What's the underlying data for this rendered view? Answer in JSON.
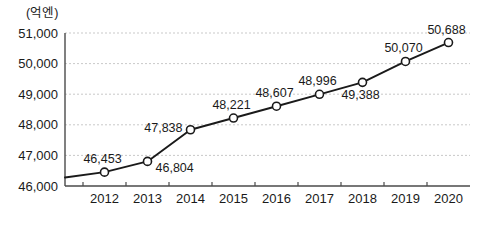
{
  "chart_data": {
    "type": "line",
    "title": "",
    "subtitle": "",
    "xlabel": "",
    "ylabel": "",
    "unit_label": "(억엔)",
    "categories": [
      "2012",
      "2013",
      "2014",
      "2015",
      "2016",
      "2017",
      "2018",
      "2019",
      "2020"
    ],
    "values": [
      46453,
      46804,
      47838,
      48221,
      48607,
      48996,
      49388,
      50070,
      50688
    ],
    "point_labels": [
      "46,453",
      "46,804",
      "47,838",
      "48,221",
      "48,607",
      "48,996",
      "49,388",
      "50,070",
      "50,688"
    ],
    "label_placement": [
      "above",
      "right",
      "left",
      "above",
      "above",
      "above",
      "below",
      "above",
      "above"
    ],
    "ylim": [
      46000,
      51000
    ],
    "ytick_values": [
      46000,
      47000,
      48000,
      49000,
      50000,
      51000
    ],
    "ytick_labels": [
      "46,000",
      "47,000",
      "48,000",
      "49,000",
      "50,000",
      "51,000"
    ],
    "xtick_labels": [
      "2012",
      "2013",
      "2014",
      "2015",
      "2016",
      "2017",
      "2018",
      "2019",
      "2020"
    ],
    "grid": true,
    "grid_axis": "y",
    "legend": false,
    "legend_position": "none",
    "marker": "open-circle",
    "series": [
      {
        "name": "value",
        "values": [
          46453,
          46804,
          47838,
          48221,
          48607,
          48996,
          49388,
          50070,
          50688
        ]
      }
    ]
  },
  "colors": {
    "line": "#1a1a1a",
    "marker_fill": "#ffffff",
    "marker_stroke": "#1a1a1a",
    "grid": "#c9c9c9",
    "axis": "#4a4a4a",
    "text": "#1a1a1a",
    "background": "#ffffff"
  }
}
